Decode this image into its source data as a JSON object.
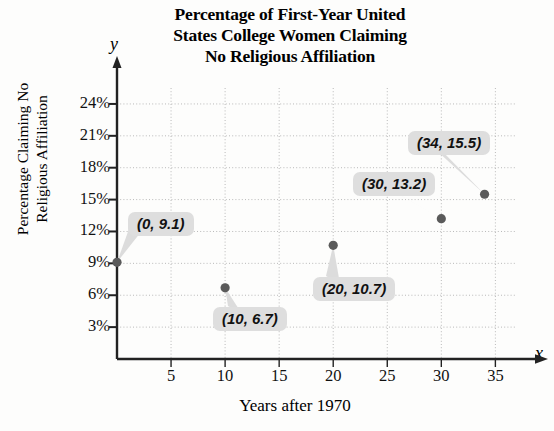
{
  "chart_data": {
    "type": "scatter",
    "title": "Percentage of First-Year United States College Women Claiming No Religious Affiliation",
    "title_lines": [
      "Percentage of First-Year United",
      "States College Women Claiming",
      "No Religious Affiliation"
    ],
    "xlabel": "Years after 1970",
    "ylabel": "Percentage Claiming No Religious Affiliation",
    "ylabel_lines": [
      "Percentage Claiming No",
      "Religious Affiliation"
    ],
    "x_axis_letter": "x",
    "y_axis_letter": "y",
    "grid": true,
    "legend": "none",
    "xlim": [
      0,
      37
    ],
    "ylim": [
      0,
      25.5
    ],
    "xticks": [
      5,
      10,
      15,
      20,
      25,
      30,
      35
    ],
    "xtick_labels": [
      "5",
      "10",
      "15",
      "20",
      "25",
      "30",
      "35"
    ],
    "yticks": [
      3,
      6,
      9,
      12,
      15,
      18,
      21,
      24
    ],
    "ytick_labels": [
      "3%",
      "6%",
      "9%",
      "12%",
      "15%",
      "18%",
      "21%",
      "24%"
    ],
    "x": [
      0,
      10,
      20,
      30,
      34
    ],
    "y": [
      9.1,
      6.7,
      10.7,
      13.2,
      15.5
    ],
    "point_labels": [
      "(0, 9.1)",
      "(10, 6.7)",
      "(20, 10.7)",
      "(30, 13.2)",
      "(34, 15.5)"
    ],
    "points": [
      {
        "x": 0,
        "y": 9.1,
        "label": "(0, 9.1)"
      },
      {
        "x": 10,
        "y": 6.7,
        "label": "(10, 6.7)"
      },
      {
        "x": 20,
        "y": 10.7,
        "label": "(20, 10.7)"
      },
      {
        "x": 30,
        "y": 13.2,
        "label": "(30, 13.2)"
      },
      {
        "x": 34,
        "y": 15.5,
        "label": "(34, 15.5)"
      }
    ],
    "colors": {
      "point": "#5a5a5a",
      "axis": "#222222",
      "grid": "#b9b9b9",
      "callout_background": "#dedede",
      "text": "#111111",
      "background": "#fdfdfc"
    }
  }
}
